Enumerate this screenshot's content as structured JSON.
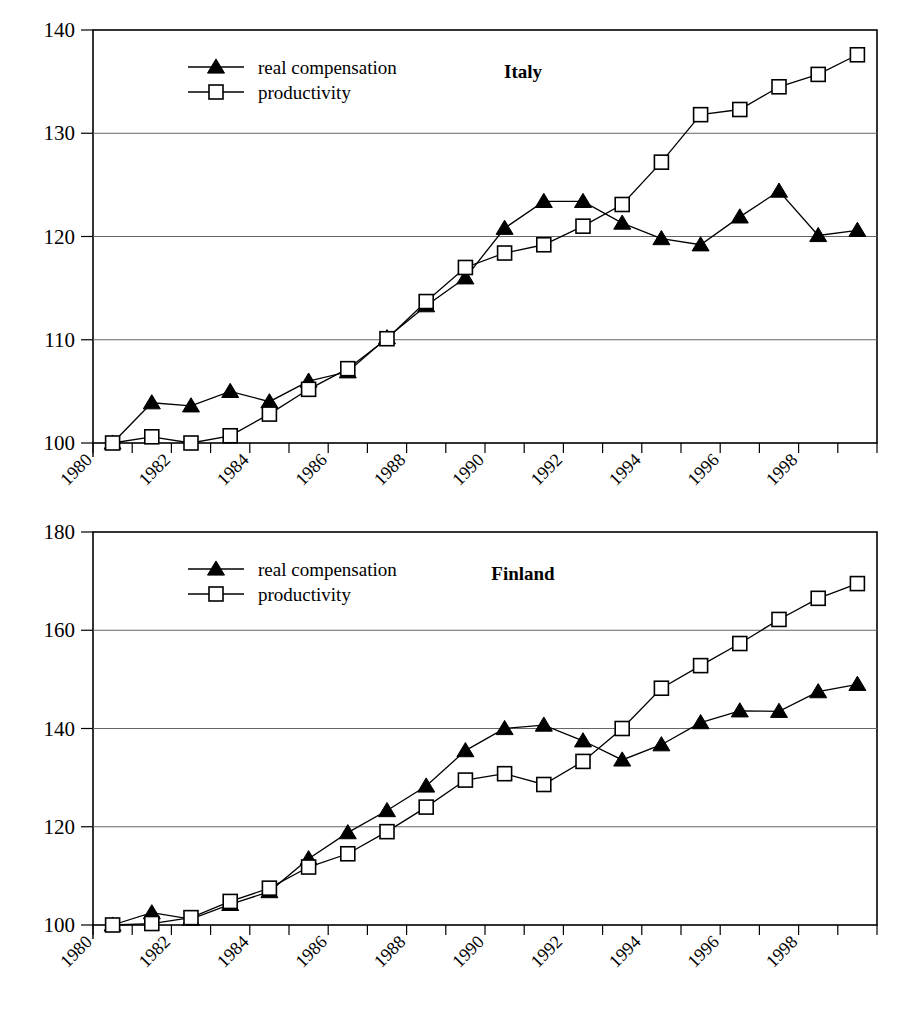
{
  "figure": {
    "background": "#ffffff",
    "line_color": "#000000",
    "grid_color": "#888888"
  },
  "charts": [
    {
      "id": "italy",
      "title": "Italy",
      "type": "line",
      "xlabel": "",
      "ylabel": "",
      "grid": true,
      "legend_position": "top-left-inside",
      "xlim": [
        1980,
        2000
      ],
      "ylim": [
        100,
        140
      ],
      "yticks": [
        100,
        110,
        120,
        130,
        140
      ],
      "ytick_labels": [
        "100",
        "110",
        "120",
        "130",
        "140"
      ],
      "xticks": [
        1980,
        1981,
        1982,
        1983,
        1984,
        1985,
        1986,
        1987,
        1988,
        1989,
        1990,
        1991,
        1992,
        1993,
        1994,
        1995,
        1996,
        1997,
        1998,
        1999,
        2000
      ],
      "xtick_labels": [
        "1980",
        "1982",
        "1984",
        "1986",
        "1988",
        "1990",
        "1992",
        "1994",
        "1996",
        "1998"
      ],
      "xtick_label_years": [
        1980,
        1982,
        1984,
        1986,
        1988,
        1990,
        1992,
        1994,
        1996,
        1998
      ],
      "x": [
        1980,
        1981,
        1982,
        1983,
        1984,
        1985,
        1986,
        1987,
        1988,
        1989,
        1990,
        1991,
        1992,
        1993,
        1994,
        1995,
        1996,
        1997,
        1998,
        1999
      ],
      "series": [
        {
          "name": "real compensation",
          "marker": "triangle",
          "fill": "#000000",
          "values": [
            100.0,
            103.9,
            103.6,
            105.0,
            104.0,
            106.0,
            106.9,
            110.2,
            113.3,
            116.0,
            120.8,
            123.4,
            123.4,
            121.3,
            119.8,
            119.2,
            121.9,
            124.4,
            120.1,
            120.6
          ]
        },
        {
          "name": "productivity",
          "marker": "square",
          "fill": "#ffffff",
          "values": [
            100.0,
            100.6,
            100.0,
            100.7,
            102.8,
            105.2,
            107.2,
            110.1,
            113.7,
            117.0,
            118.4,
            119.2,
            121.0,
            123.1,
            127.2,
            131.8,
            132.3,
            134.5,
            135.7,
            137.6
          ]
        }
      ]
    },
    {
      "id": "finland",
      "title": "Finland",
      "type": "line",
      "xlabel": "",
      "ylabel": "",
      "grid": true,
      "legend_position": "top-left-inside",
      "xlim": [
        1980,
        2000
      ],
      "ylim": [
        100,
        180
      ],
      "yticks": [
        100,
        120,
        140,
        160,
        180
      ],
      "ytick_labels": [
        "100",
        "120",
        "140",
        "160",
        "180"
      ],
      "xticks": [
        1980,
        1981,
        1982,
        1983,
        1984,
        1985,
        1986,
        1987,
        1988,
        1989,
        1990,
        1991,
        1992,
        1993,
        1994,
        1995,
        1996,
        1997,
        1998,
        1999,
        2000
      ],
      "xtick_labels": [
        "1980",
        "1982",
        "1984",
        "1986",
        "1988",
        "1990",
        "1992",
        "1994",
        "1996",
        "1998"
      ],
      "xtick_label_years": [
        1980,
        1982,
        1984,
        1986,
        1988,
        1990,
        1992,
        1994,
        1996,
        1998
      ],
      "x": [
        1980,
        1981,
        1982,
        1983,
        1984,
        1985,
        1986,
        1987,
        1988,
        1989,
        1990,
        1991,
        1992,
        1993,
        1994,
        1995,
        1996,
        1997,
        1998,
        1999
      ],
      "series": [
        {
          "name": "real compensation",
          "marker": "triangle",
          "fill": "#000000",
          "values": [
            100.0,
            102.5,
            101.2,
            104.2,
            106.8,
            113.5,
            118.8,
            123.3,
            128.3,
            135.5,
            140.0,
            140.7,
            137.5,
            133.6,
            136.7,
            141.2,
            143.6,
            143.5,
            147.5,
            149.0
          ]
        },
        {
          "name": "productivity",
          "marker": "square",
          "fill": "#ffffff",
          "values": [
            100.0,
            100.3,
            101.5,
            104.8,
            107.5,
            111.8,
            114.5,
            119.0,
            124.0,
            129.5,
            130.8,
            128.6,
            133.3,
            140.0,
            148.2,
            152.8,
            157.3,
            162.2,
            166.5,
            169.5
          ]
        }
      ]
    }
  ],
  "legend": {
    "entries": [
      {
        "label": "real compensation",
        "marker": "triangle"
      },
      {
        "label": "productivity",
        "marker": "square"
      }
    ]
  }
}
